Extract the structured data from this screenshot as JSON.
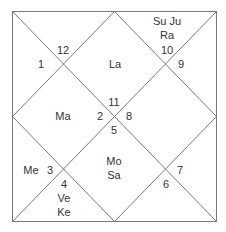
{
  "chart": {
    "type": "north-indian-birth-chart",
    "line_color": "#7a7a7a",
    "houses": [
      {
        "sign": "12",
        "planets": [
          "La"
        ]
      },
      {
        "sign": "1",
        "planets": []
      },
      {
        "sign": "2",
        "planets": [
          "Ma"
        ]
      },
      {
        "sign": "3",
        "planets": [
          "Me"
        ]
      },
      {
        "sign": "4",
        "planets": [
          "Ve",
          "Ke"
        ]
      },
      {
        "sign": "5",
        "planets": [
          "Mo",
          "Sa"
        ]
      },
      {
        "sign": "6",
        "planets": []
      },
      {
        "sign": "7",
        "planets": []
      },
      {
        "sign": "8",
        "planets": []
      },
      {
        "sign": "9",
        "planets": []
      },
      {
        "sign": "10",
        "planets": [
          "Su Ju",
          "Ra"
        ]
      },
      {
        "sign": "11",
        "planets": []
      }
    ]
  },
  "labels": {
    "n12": "12",
    "n1": "1",
    "n11": "11",
    "n2": "2",
    "n8": "8",
    "n5": "5",
    "n10": "10",
    "n9": "9",
    "n3": "3",
    "n4": "4",
    "n7": "7",
    "n6": "6",
    "la": "La",
    "ma": "Ma",
    "mo": "Mo",
    "sa": "Sa",
    "suju": "Su Ju",
    "ra": "Ra",
    "me": "Me",
    "ve": "Ve",
    "ke": "Ke"
  }
}
